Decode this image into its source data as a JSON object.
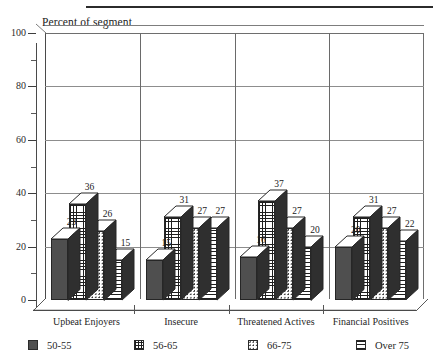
{
  "chart_data": {
    "type": "bar",
    "title": "Percent of segment",
    "xlabel": "",
    "ylabel": "Percent of segment",
    "ylim": [
      0,
      100
    ],
    "ytick_interval": 20,
    "yminor_interval": 10,
    "grid": true,
    "legend_position": "bottom",
    "style": "3d-clustered-bar",
    "categories": [
      "Upbeat Enjoyers",
      "Insecure",
      "Threatened Actives",
      "Financial Positives"
    ],
    "ytick_labels": [
      "0",
      "20",
      "40",
      "60",
      "80",
      "100"
    ],
    "series": [
      {
        "name": "50-55",
        "pattern": "solid-dark",
        "values": [
          23,
          15,
          16,
          20
        ]
      },
      {
        "name": "56-65",
        "pattern": "grid",
        "values": [
          36,
          31,
          37,
          31
        ]
      },
      {
        "name": "66-75",
        "pattern": "dots",
        "values": [
          26,
          27,
          27,
          27
        ]
      },
      {
        "name": "Over 75",
        "pattern": "h-lines",
        "values": [
          15,
          27,
          20,
          22
        ]
      }
    ]
  },
  "legend": {
    "items": [
      {
        "label": "50-55"
      },
      {
        "label": "56-65"
      },
      {
        "label": "66-75"
      },
      {
        "label": "Over 75"
      }
    ]
  },
  "colors": {
    "solid_fill": "#4f4f4f",
    "pattern_ink": "#1f1f1f",
    "axis": "#4a4a4a",
    "gridline": "#8d8d8d",
    "text": "#1a1a1a",
    "background": "#ffffff"
  }
}
